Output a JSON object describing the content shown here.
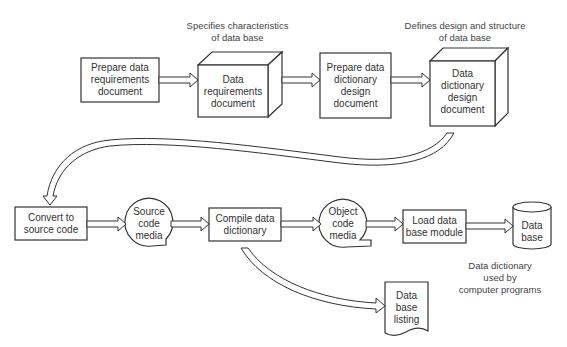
{
  "diagram": {
    "type": "flowchart",
    "annotations": {
      "data_requirements": [
        "Specifies characteristics",
        "of data base"
      ],
      "design_document": [
        "Defines design and structure",
        "of data base"
      ],
      "database_usage": [
        "Data dictionary",
        "used by",
        "computer programs"
      ]
    },
    "nodes": {
      "prepare_requirements": [
        "Prepare data",
        "requirements",
        "document"
      ],
      "requirements_doc": [
        "Data",
        "requirements",
        "document"
      ],
      "prepare_design": [
        "Prepare data",
        "dictionary",
        "design",
        "document"
      ],
      "design_doc": [
        "Data",
        "dictionary",
        "design",
        "document"
      ],
      "convert_source": [
        "Convert to",
        "source code"
      ],
      "source_media": [
        "Source",
        "code",
        "media"
      ],
      "compile": [
        "Compile data",
        "dictionary"
      ],
      "object_media": [
        "Object",
        "code",
        "media"
      ],
      "load_module": [
        "Load data",
        "base module"
      ],
      "database": [
        "Data",
        "base"
      ],
      "listing": [
        "Data",
        "base",
        "listing"
      ]
    },
    "edges": [
      [
        "prepare_requirements",
        "requirements_doc"
      ],
      [
        "requirements_doc",
        "prepare_design"
      ],
      [
        "prepare_design",
        "design_doc"
      ],
      [
        "design_doc",
        "convert_source"
      ],
      [
        "convert_source",
        "source_media"
      ],
      [
        "source_media",
        "compile"
      ],
      [
        "compile",
        "object_media"
      ],
      [
        "object_media",
        "load_module"
      ],
      [
        "load_module",
        "database"
      ],
      [
        "compile",
        "listing"
      ]
    ]
  }
}
